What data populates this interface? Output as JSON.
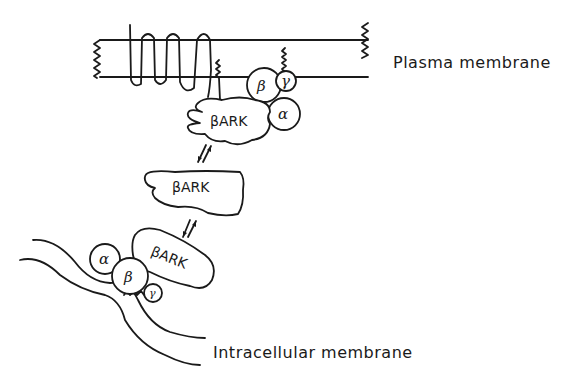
{
  "diagram": {
    "labels": {
      "plasma_membrane": "Plasma membrane",
      "intracellular_membrane": "Intracellular membrane"
    },
    "proteins": {
      "bark_top": "βARK",
      "bark_middle": "βARK",
      "bark_bottom": "βARK"
    },
    "subunits": {
      "top_beta": "β",
      "top_gamma": "γ",
      "top_alpha": "α",
      "bottom_alpha": "α",
      "bottom_beta": "β",
      "bottom_gamma": "γ"
    },
    "arrows": {
      "upper": "⇅ equilibrium",
      "lower": "⇅ equilibrium"
    }
  }
}
